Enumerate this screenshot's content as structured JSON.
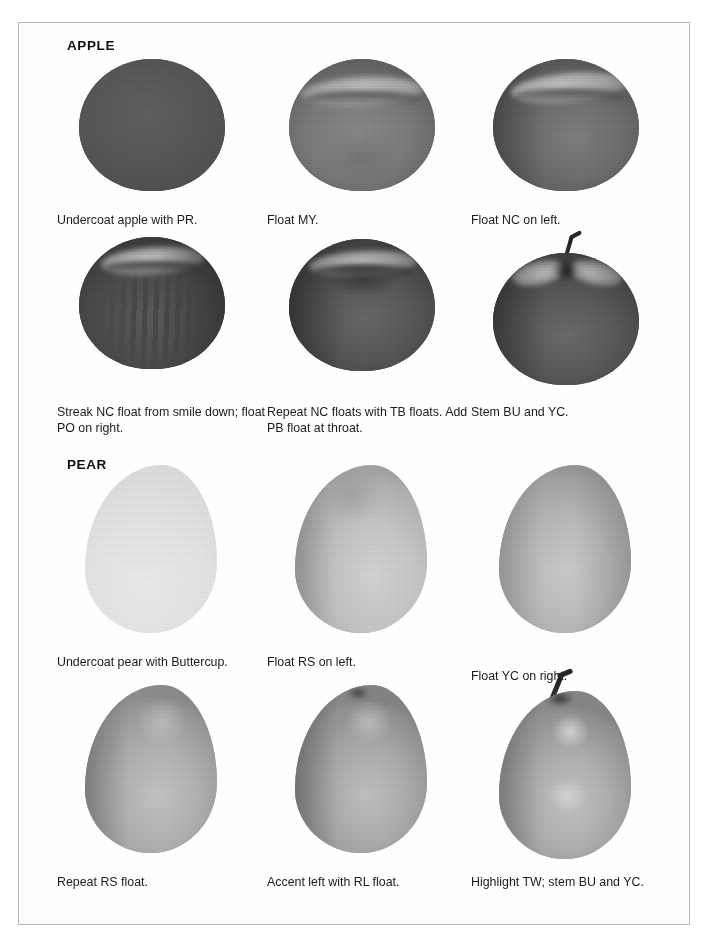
{
  "page": {
    "border_color": "#b9b9b9",
    "background": "#ffffff",
    "ink_color": "#1b1b1b"
  },
  "sections": [
    {
      "id": "apple",
      "title": "APPLE"
    },
    {
      "id": "pear",
      "title": "PEAR"
    }
  ],
  "steps": {
    "apple": [
      {
        "caption": "Undercoat apple with PR.",
        "stage": "undercoat"
      },
      {
        "caption": "Float MY.",
        "stage": "float-my"
      },
      {
        "caption": "Float NC on left.",
        "stage": "float-nc-left"
      },
      {
        "caption": "Streak NC float from smile down; float PO on right.",
        "stage": "streak-nc"
      },
      {
        "caption": "Repeat NC floats with TB floats. Add PB float at throat.",
        "stage": "repeat-nc-tb"
      },
      {
        "caption": "Stem BU and YC.",
        "stage": "stem"
      }
    ],
    "pear": [
      {
        "caption": "Undercoat pear with Buttercup.",
        "stage": "undercoat"
      },
      {
        "caption": "Float RS on left.",
        "stage": "float-rs-left"
      },
      {
        "caption": "Float YC on right.",
        "stage": "float-yc-right"
      },
      {
        "caption": "Repeat RS float.",
        "stage": "repeat-rs"
      },
      {
        "caption": "Accent left with RL float.",
        "stage": "accent-rl"
      },
      {
        "caption": "Highlight TW; stem BU and YC.",
        "stage": "highlight-stem"
      }
    ]
  },
  "palette": {
    "apple_undercoat": "#585858",
    "apple_mid": "#6e6e6e",
    "apple_dark": "#3f3f3f",
    "apple_light": "#cfcfcf",
    "pear_undercoat": "#e9e9e9",
    "pear_mid": "#bdbdbd",
    "pear_dark": "#8f8f8f",
    "pear_light": "#dedede",
    "stem_color": "#2b2b2b"
  }
}
